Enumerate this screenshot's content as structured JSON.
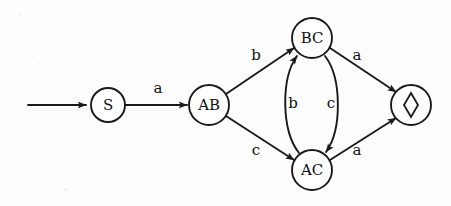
{
  "diagram": {
    "background_color": "#fdfdfd",
    "ink_color": "#1a1a1a",
    "width": 451,
    "height": 206
  },
  "states": [
    {
      "id": "S",
      "label": "S",
      "cx": 108,
      "cy": 105,
      "r": 17,
      "kind": "start",
      "glyph": null
    },
    {
      "id": "AB",
      "label": "AB",
      "cx": 209,
      "cy": 105,
      "r": 20,
      "kind": "normal",
      "glyph": null
    },
    {
      "id": "BC",
      "label": "BC",
      "cx": 312,
      "cy": 38,
      "r": 20,
      "kind": "normal",
      "glyph": null
    },
    {
      "id": "AC",
      "label": "AC",
      "cx": 312,
      "cy": 170,
      "r": 20,
      "kind": "normal",
      "glyph": null
    },
    {
      "id": "SINK",
      "label": "",
      "cx": 411,
      "cy": 105,
      "r": 20,
      "kind": "sink",
      "glyph": "diamond"
    }
  ],
  "start_arrow": {
    "name": "start-arrow",
    "x1": 28,
    "y1": 105,
    "x2": 88,
    "y2": 105
  },
  "transitions": [
    {
      "from": "S",
      "to": "AB",
      "label": "a",
      "label_x": 158,
      "label_y": 88,
      "shape": "straight"
    },
    {
      "from": "AB",
      "to": "BC",
      "label": "b",
      "label_x": 256,
      "label_y": 55,
      "shape": "straight"
    },
    {
      "from": "AB",
      "to": "AC",
      "label": "c",
      "label_x": 256,
      "label_y": 150,
      "shape": "straight"
    },
    {
      "from": "AC",
      "to": "BC",
      "label": "b",
      "label_x": 293,
      "label_y": 103,
      "shape": "curve-left"
    },
    {
      "from": "BC",
      "to": "AC",
      "label": "c",
      "label_x": 330,
      "label_y": 103,
      "shape": "curve-right"
    },
    {
      "from": "BC",
      "to": "SINK",
      "label": "a",
      "label_x": 356,
      "label_y": 55,
      "shape": "straight"
    },
    {
      "from": "AC",
      "to": "SINK",
      "label": "a",
      "label_x": 356,
      "label_y": 150,
      "shape": "straight"
    }
  ],
  "alphabet": [
    "a",
    "b",
    "c"
  ]
}
